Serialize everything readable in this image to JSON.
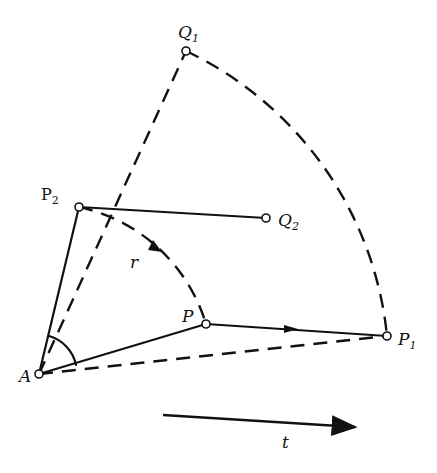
{
  "diagram": {
    "points": {
      "A": {
        "label": "A",
        "x": 39,
        "y": 374
      },
      "P": {
        "label": "P",
        "x": 206,
        "y": 324
      },
      "P1": {
        "label": "P",
        "sub": "1",
        "x": 387,
        "y": 336
      },
      "P2": {
        "label": "P",
        "sub": "2",
        "x": 79,
        "y": 207
      },
      "Q1": {
        "label": "Q",
        "sub": "1",
        "x": 186,
        "y": 51
      },
      "Q2": {
        "label": "Q",
        "sub": "2",
        "x": 266,
        "y": 218
      }
    },
    "radius_label": "r",
    "time_label": "t",
    "edges_solid": [
      "A-P",
      "P-P1",
      "A-P2",
      "P2-Q2"
    ],
    "edges_dashed": [
      "A-P1",
      "A-Q1",
      "arc Q1-P1",
      "arc P2-P"
    ]
  }
}
